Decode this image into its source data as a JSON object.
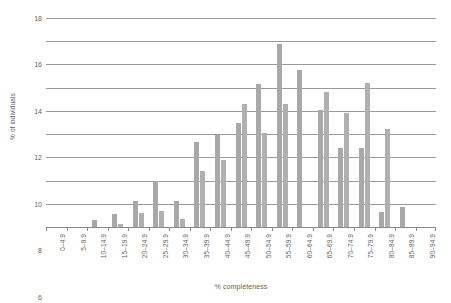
{
  "chart_data": {
    "type": "bar",
    "title": "",
    "subtitle": "",
    "xlabel": "% completeness",
    "ylabel": "% of individuals",
    "ylim": [
      0,
      18
    ],
    "ytick_step": 2,
    "yticks": [
      18,
      16,
      14,
      12,
      10,
      8,
      6,
      4,
      2,
      0
    ],
    "grid": true,
    "legend": "none",
    "bar_color": "#a8a8a8",
    "axis_color": "#8a8a8a",
    "text_color": "#5f5f5f",
    "categories": [
      "0–4.9",
      "5–9.9",
      "10–14.9",
      "15–19.9",
      "20–24.9",
      "25–29.9",
      "30–34.9",
      "35–39.9",
      "40–44.9",
      "45–49.9",
      "50–54.9",
      "55–59.9",
      "60–64.9",
      "65–69.9",
      "70–74.9",
      "75–79.9",
      "80–84.9",
      "85–89.9",
      "90–94.9"
    ],
    "series": [
      {
        "name": "Series 1",
        "values": [
          0,
          0,
          0.6,
          1.1,
          2.2,
          4.0,
          2.2,
          7.3,
          7.9,
          9.0,
          12.3,
          15.8,
          13.5,
          10.1,
          6.8,
          6.8,
          1.3,
          1.7,
          0
        ]
      },
      {
        "name": "Series 2",
        "values": [
          0,
          0,
          0,
          0.25,
          1.25,
          1.4,
          0.65,
          4.8,
          5.8,
          10.6,
          8.1,
          10.6,
          0,
          11.6,
          9.8,
          12.4,
          8.4,
          0,
          0
        ]
      }
    ]
  }
}
